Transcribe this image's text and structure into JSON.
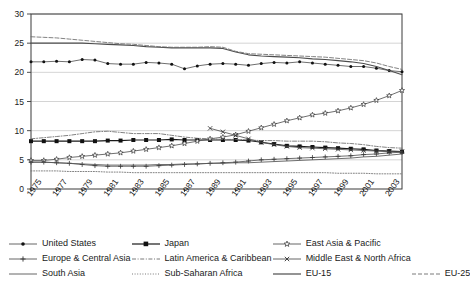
{
  "chart_data": {
    "type": "line",
    "title": "",
    "subtitle": "",
    "xlabel": "",
    "ylabel": "",
    "xlim": [
      1975,
      2004
    ],
    "ylim": [
      0,
      30
    ],
    "yticks": [
      0,
      5,
      10,
      15,
      20,
      25,
      30
    ],
    "ytick_labels": [
      "0",
      "5",
      "10",
      "15",
      "20",
      "25",
      "30"
    ],
    "grid": "horizontal",
    "legend_position": "bottom",
    "x": [
      1975,
      1976,
      1977,
      1978,
      1979,
      1980,
      1981,
      1982,
      1983,
      1984,
      1985,
      1986,
      1987,
      1988,
      1989,
      1990,
      1991,
      1992,
      1993,
      1994,
      1995,
      1996,
      1997,
      1998,
      1999,
      2000,
      2001,
      2002,
      2003,
      2004
    ],
    "xtick_values": [
      1975,
      1977,
      1979,
      1981,
      1983,
      1985,
      1987,
      1989,
      1991,
      1993,
      1995,
      1997,
      1999,
      2001,
      2003
    ],
    "xtick_labels": [
      "1975",
      "1977",
      "1979",
      "1981",
      "1983",
      "1985",
      "1987",
      "1989",
      "1991",
      "1993",
      "1995",
      "1997",
      "1999",
      "2001",
      "2003"
    ],
    "series": [
      {
        "name": "United States",
        "marker": "dot",
        "style": "solid-thin",
        "color": "#555555",
        "values": [
          21.8,
          21.8,
          21.9,
          21.8,
          22.2,
          22.1,
          21.5,
          21.4,
          21.4,
          21.7,
          21.6,
          21.4,
          20.6,
          21.1,
          21.4,
          21.5,
          21.4,
          21.2,
          21.5,
          21.7,
          21.6,
          21.8,
          21.6,
          21.4,
          21.2,
          21.0,
          21.0,
          20.7,
          20.3,
          20.1
        ]
      },
      {
        "name": "Japan",
        "marker": "square",
        "style": "solid",
        "color": "#1a1a1a",
        "values": [
          8.2,
          8.2,
          8.2,
          8.2,
          8.2,
          8.2,
          8.3,
          8.3,
          8.4,
          8.4,
          8.4,
          8.5,
          8.4,
          8.4,
          8.4,
          8.4,
          8.4,
          8.3,
          8.0,
          7.7,
          7.4,
          7.3,
          7.2,
          7.1,
          7.0,
          6.9,
          6.8,
          6.6,
          6.5,
          6.4
        ]
      },
      {
        "name": "East Asia & Pacific",
        "marker": "star",
        "style": "solid-thin",
        "color": "#555555",
        "values": [
          4.9,
          4.9,
          5.1,
          5.4,
          5.6,
          5.8,
          6.0,
          6.2,
          6.5,
          6.8,
          7.1,
          7.4,
          7.8,
          8.2,
          8.6,
          8.9,
          9.3,
          9.9,
          10.5,
          11.1,
          11.7,
          12.2,
          12.7,
          13.0,
          13.4,
          13.9,
          14.5,
          15.2,
          16.0,
          16.9
        ]
      },
      {
        "name": "Europe & Central Asia",
        "marker": "plus",
        "style": "solid-thin",
        "color": "#555555",
        "values": [
          4.6,
          4.6,
          4.5,
          4.4,
          4.2,
          4.0,
          3.9,
          3.9,
          3.9,
          3.9,
          4.0,
          4.1,
          4.2,
          4.3,
          4.4,
          4.5,
          4.6,
          4.8,
          5.0,
          5.1,
          5.2,
          5.3,
          5.4,
          5.5,
          5.6,
          5.7,
          5.9,
          6.0,
          6.2,
          6.3
        ]
      },
      {
        "name": "Latin America & Caribbean",
        "marker": "none",
        "style": "dash-dot",
        "color": "#6b6b6b",
        "values": [
          8.6,
          8.8,
          9.0,
          9.2,
          9.5,
          9.8,
          9.9,
          9.7,
          9.5,
          9.5,
          9.5,
          9.2,
          8.9,
          8.7,
          8.6,
          8.5,
          8.5,
          8.4,
          8.3,
          8.3,
          8.2,
          8.2,
          8.2,
          8.1,
          7.9,
          7.8,
          7.6,
          7.3,
          7.1,
          7.0
        ]
      },
      {
        "name": "Middle East & North Africa",
        "marker": "x",
        "style": "solid-thin",
        "color": "#555555",
        "values": [
          null,
          null,
          null,
          null,
          null,
          null,
          null,
          null,
          null,
          null,
          null,
          null,
          null,
          null,
          10.4,
          9.8,
          9.2,
          8.6,
          8.0,
          7.6,
          7.3,
          7.1,
          7.0,
          6.9,
          6.8,
          6.7,
          6.6,
          6.5,
          6.4,
          6.4
        ]
      },
      {
        "name": "South Asia",
        "marker": "none",
        "style": "solid-thin",
        "color": "#555555",
        "values": [
          4.6,
          4.6,
          4.5,
          4.4,
          4.3,
          4.2,
          4.1,
          4.1,
          4.1,
          4.1,
          4.2,
          4.2,
          4.3,
          4.3,
          4.4,
          4.4,
          4.5,
          4.5,
          4.6,
          4.7,
          4.8,
          4.9,
          5.0,
          5.1,
          5.2,
          5.3,
          5.5,
          5.6,
          5.8,
          6.0
        ]
      },
      {
        "name": "Sub-Saharan Africa",
        "marker": "none",
        "style": "dotted",
        "color": "#6b6b6b",
        "values": [
          3.1,
          3.1,
          3.1,
          3.0,
          3.0,
          3.0,
          2.9,
          2.9,
          2.8,
          2.8,
          2.8,
          2.8,
          2.8,
          2.8,
          2.8,
          2.8,
          2.8,
          2.8,
          2.8,
          2.8,
          2.8,
          2.8,
          2.8,
          2.8,
          2.7,
          2.7,
          2.7,
          2.6,
          2.6,
          2.6
        ]
      },
      {
        "name": "EU-15",
        "marker": "none",
        "style": "solid",
        "color": "#4d4d4d",
        "values": [
          25.0,
          25.0,
          25.0,
          25.0,
          25.0,
          24.9,
          24.8,
          24.7,
          24.6,
          24.4,
          24.3,
          24.2,
          24.2,
          24.2,
          24.2,
          24.1,
          23.5,
          23.0,
          22.8,
          22.7,
          22.6,
          22.5,
          22.3,
          22.2,
          22.0,
          21.8,
          21.5,
          21.0,
          20.3,
          19.6
        ]
      },
      {
        "name": "EU-25",
        "marker": "none",
        "style": "dashed",
        "color": "#6b6b6b",
        "values": [
          26.1,
          26.0,
          25.9,
          25.7,
          25.5,
          25.3,
          25.1,
          24.9,
          24.8,
          24.6,
          24.4,
          24.3,
          24.3,
          24.3,
          24.4,
          24.3,
          23.6,
          23.2,
          23.1,
          23.0,
          22.9,
          22.8,
          22.7,
          22.6,
          22.4,
          22.2,
          22.0,
          21.6,
          21.0,
          20.5
        ]
      }
    ]
  },
  "legend": {
    "rows": [
      [
        {
          "label": "United States",
          "key": "us"
        },
        {
          "label": "Japan",
          "key": "japan"
        },
        {
          "label": "East Asia & Pacific",
          "key": "eap"
        }
      ],
      [
        {
          "label": "Europe & Central Asia",
          "key": "eca"
        },
        {
          "label": "Latin America & Caribbean",
          "key": "lac"
        },
        {
          "label": "Middle East & North Africa",
          "key": "mena"
        }
      ],
      [
        {
          "label": "South Asia",
          "key": "sa"
        },
        {
          "label": "Sub-Saharan Africa",
          "key": "ssa"
        },
        {
          "label": "EU-15",
          "key": "eu15"
        },
        {
          "label": "EU-25",
          "key": "eu25"
        }
      ]
    ]
  },
  "colors": {
    "axis": "#3b3b3b",
    "grid": "#c9c9c9",
    "text": "#1a1a1a",
    "line_dark": "#1a1a1a",
    "line_gray": "#555555"
  }
}
